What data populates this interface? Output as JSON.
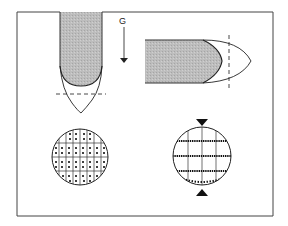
{
  "diagram": {
    "gravity_label": "G",
    "panels": [
      {
        "id": "vertical-pipette",
        "orientation": "vertical",
        "fill": "#b8b8b8"
      },
      {
        "id": "horizontal-pipette",
        "orientation": "horizontal",
        "fill": "#b8b8b8"
      },
      {
        "id": "dot-grid-cross-section",
        "pattern": "uniform dots in grid"
      },
      {
        "id": "stratified-cross-section",
        "pattern": "dots settled on horizontal lines"
      }
    ],
    "colors": {
      "stroke": "#222222",
      "shade": "#b8b8b8",
      "frame": "#444444"
    }
  }
}
